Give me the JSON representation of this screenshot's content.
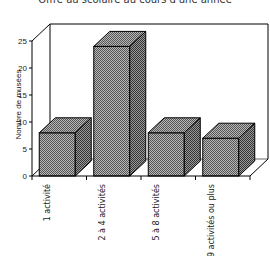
{
  "title": "Offre au scolaire au cours d'une année",
  "chart_data": {
    "type": "bar",
    "style": "3d",
    "title": "Offre au scolaire au cours d'une année",
    "xlabel": "",
    "ylabel": "Nombre de musées",
    "categories": [
      "1 activité",
      "2 à 4 activités",
      "5 à 8 activités",
      "9 activités ou plus"
    ],
    "values": [
      8,
      24,
      8,
      7
    ],
    "ylim": [
      0,
      25
    ],
    "yticks": [
      0,
      5,
      10,
      15,
      20,
      25
    ],
    "grid": false,
    "legend": null,
    "bar_fill": "cross-hatched gray",
    "colors": {
      "bar": "#8a8a8a",
      "edge": "#000000"
    }
  }
}
